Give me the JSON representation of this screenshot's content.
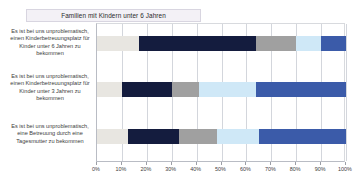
{
  "chart_data": {
    "type": "bar",
    "orientation": "horizontal",
    "stacked": true,
    "stacked_100": true,
    "title": "Familien mit Kindern unter 6 Jahren",
    "xlabel": "",
    "ylabel": "",
    "xlim": [
      0,
      100
    ],
    "xticks": [
      0,
      10,
      20,
      30,
      40,
      50,
      60,
      70,
      80,
      90,
      100
    ],
    "xtick_labels": [
      "0%",
      "10%",
      "20%",
      "30%",
      "40%",
      "50%",
      "60%",
      "70%",
      "80%",
      "90%",
      "100%"
    ],
    "grid": "vertical",
    "legend": "none",
    "categories": [
      "Es ist bei uns unproblematisch, einen Kinderbetreuungsplatz für Kinder unter 6 Jahren zu bekommen",
      "Es ist bei uns unproblematisch, einen Kinderbetreuungsplatz für Kinder unter 3 Jahren zu bekommen",
      "Es ist bei uns unproblematisch, eine Betreuung durch eine Tagesmutter zu bekommen"
    ],
    "series": [
      {
        "name": "Kategorie 1",
        "color": "#e8e6e1",
        "values": [
          17,
          10,
          12.5
        ]
      },
      {
        "name": "Kategorie 2",
        "color": "#141c3e",
        "values": [
          47,
          20,
          20.5
        ]
      },
      {
        "name": "Kategorie 3",
        "color": "#a0a0a0",
        "values": [
          16,
          11,
          15
        ]
      },
      {
        "name": "Kategorie 4",
        "color": "#cfe8f7",
        "values": [
          10,
          23,
          17
        ]
      },
      {
        "name": "Kategorie 5",
        "color": "#3b5ba9",
        "values": [
          10,
          36,
          35
        ]
      }
    ]
  },
  "colors": {
    "title_background": "#f3f1f6",
    "title_border": "#d8d5e0",
    "gridline": "#d3d6dc",
    "axis": "#b9bcc4",
    "text": "#3c3c3c",
    "plot_background": "#ffffff"
  }
}
